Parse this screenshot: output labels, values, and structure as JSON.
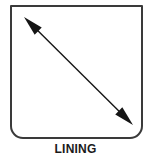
{
  "figure": {
    "caption": "LINING",
    "panel": {
      "fill_color": "#ffffff",
      "stroke_color": "#3a3a3a",
      "stroke_width": 2,
      "corner_radius_bottom": 12,
      "corner_radius_top": 0,
      "bounds": {
        "x": 11,
        "y": 6,
        "width": 131,
        "height": 132
      }
    },
    "arrow": {
      "style": "double-headed",
      "color": "#151515",
      "shaft_width": 1,
      "start": {
        "x": 24,
        "y": 17
      },
      "end": {
        "x": 133,
        "y": 125
      },
      "head_length": 20,
      "head_half_width": 5
    }
  }
}
